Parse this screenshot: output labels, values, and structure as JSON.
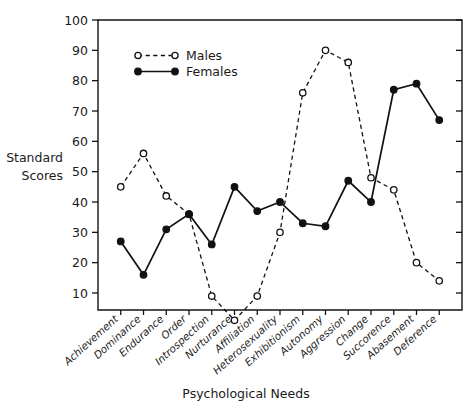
{
  "chart_data": {
    "type": "line",
    "title": "",
    "xlabel": "Psychological Needs",
    "ylabel": "Standard Scores",
    "ylim": [
      0,
      100
    ],
    "yticks": [
      10,
      20,
      30,
      40,
      50,
      60,
      70,
      80,
      90,
      100
    ],
    "grid": false,
    "legend_position": "top-left-inside",
    "categories": [
      "Achievement",
      "Dominance",
      "Endurance",
      "Order",
      "Introspection",
      "Nurturance",
      "Affiliation",
      "Heterosexuality",
      "Exhibitionism",
      "Autonomy",
      "Aggression",
      "Change",
      "Succorence",
      "Abasement",
      "Deference"
    ],
    "series": [
      {
        "name": "Males",
        "marker": "open-circle",
        "linestyle": "dashed",
        "values": [
          45,
          56,
          42,
          36,
          9,
          1,
          9,
          30,
          76,
          90,
          86,
          48,
          44,
          20,
          14
        ]
      },
      {
        "name": "Females",
        "marker": "filled-circle",
        "linestyle": "solid",
        "values": [
          27,
          16,
          31,
          36,
          26,
          45,
          37,
          40,
          33,
          32,
          47,
          40,
          77,
          79,
          67
        ]
      }
    ]
  },
  "legend": {
    "entries": [
      {
        "label": "Males"
      },
      {
        "label": "Females"
      }
    ]
  },
  "axes": {
    "y_title_line1": "Standard",
    "y_title_line2": "Scores",
    "x_title": "Psychological Needs"
  },
  "colors": {
    "ink": "#111111",
    "background": "#ffffff"
  }
}
